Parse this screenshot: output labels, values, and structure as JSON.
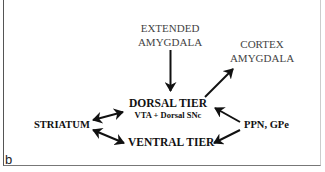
{
  "diagram": {
    "panel_label": "b",
    "nodes": {
      "extended_amygdala": {
        "line1": "EXTENDED",
        "line2": "AMYGDALA"
      },
      "cortex_amygdala": {
        "line1": "CORTEX",
        "line2": "AMYGDALA"
      },
      "dorsal_tier": {
        "title": "DORSAL TIER",
        "subtitle": "VTA + Dorsal SNc"
      },
      "striatum": {
        "label": "STRIATUM"
      },
      "ventral_tier": {
        "label": "VENTRAL TIER"
      },
      "ppn_gpe": {
        "label": "PPN, GPe"
      }
    },
    "edges": [
      {
        "from": "EXTENDED AMYGDALA",
        "to": "DORSAL TIER",
        "direction": "one-way"
      },
      {
        "from": "DORSAL TIER",
        "to": "CORTEX AMYGDALA",
        "direction": "one-way"
      },
      {
        "from": "STRIATUM",
        "to": "DORSAL TIER",
        "direction": "two-way"
      },
      {
        "from": "STRIATUM",
        "to": "VENTRAL TIER",
        "direction": "two-way"
      },
      {
        "from": "PPN, GPe",
        "to": "DORSAL TIER",
        "direction": "one-way"
      },
      {
        "from": "PPN, GPe",
        "to": "VENTRAL TIER",
        "direction": "one-way"
      }
    ],
    "colors": {
      "text": "#111111",
      "arrow": "#111111",
      "border": "#555555",
      "background": "#ffffff"
    }
  }
}
